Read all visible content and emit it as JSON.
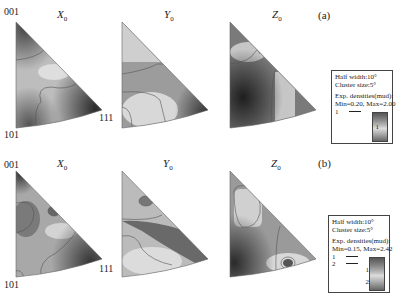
{
  "figure": {
    "rows": [
      {
        "label": "(a)",
        "plots": [
          {
            "title": "X",
            "subscript": "0"
          },
          {
            "title": "Y",
            "subscript": "0"
          },
          {
            "title": "Z",
            "subscript": "0"
          }
        ],
        "poles": {
          "top": "001",
          "bottom": "101",
          "right": "111"
        },
        "legend": {
          "half_width": "Half width:10°",
          "cluster_size": "Cluster size:5°",
          "densities_label": "Exp. densities(mud):",
          "min_max": "Min=0.20, Max=2.00",
          "levels": [
            {
              "value": "1"
            }
          ],
          "scale_ticks": [
            "1"
          ]
        }
      },
      {
        "label": "(b)",
        "plots": [
          {
            "title": "X",
            "subscript": "0"
          },
          {
            "title": "Y",
            "subscript": "0"
          },
          {
            "title": "Z",
            "subscript": "0"
          }
        ],
        "poles": {
          "top": "001",
          "bottom": "101",
          "right": "111"
        },
        "legend": {
          "half_width": "Half width:10°",
          "cluster_size": "Cluster size:5°",
          "densities_label": "Exp. densities(mud):",
          "min_max": "Min=0.15, Max=2.42",
          "levels": [
            {
              "value": "1"
            },
            {
              "value": "2"
            }
          ],
          "scale_ticks": [
            "1",
            "2"
          ]
        }
      }
    ],
    "colors": {
      "dark": "#3a3a3a",
      "mid": "#8a8a8a",
      "light": "#e0e0e0",
      "contour": "#555555"
    }
  }
}
